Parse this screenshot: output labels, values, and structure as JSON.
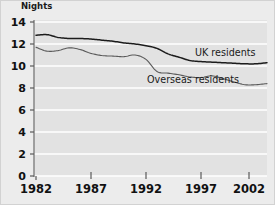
{
  "chart_data": {
    "type": "line",
    "title": "",
    "ylabel": "Nights",
    "xlabel": "",
    "ylim": [
      0,
      14
    ],
    "xlim": [
      1982,
      2003
    ],
    "grid": true,
    "grid_color": "#ffffff",
    "plot_background": "#e2e2e2",
    "figure_background": "#ececec",
    "legend_position": "inline-labels",
    "y_ticks": [
      0,
      2,
      4,
      6,
      8,
      10,
      12,
      14
    ],
    "y_tick_labels": [
      "0",
      "2",
      "4",
      "6",
      "8",
      "10",
      "12",
      "14"
    ],
    "x_ticks": [
      1982,
      1987,
      1992,
      1997,
      2002
    ],
    "x_tick_labels": [
      "1982",
      "1987",
      "1992",
      "1997",
      "2002"
    ],
    "x": [
      1982,
      1983,
      1984,
      1985,
      1986,
      1987,
      1988,
      1989,
      1990,
      1991,
      1992,
      1993,
      1994,
      1995,
      1996,
      1997,
      1998,
      1999,
      2000,
      2001,
      2002,
      2003
    ],
    "series": [
      {
        "name": "UK residents",
        "label": "UK residents",
        "color": "#1c1c1c",
        "width": 1.5,
        "values": [
          12.8,
          12.85,
          12.6,
          12.5,
          12.5,
          12.45,
          12.35,
          12.25,
          12.1,
          12.0,
          11.85,
          11.6,
          11.1,
          10.8,
          10.5,
          10.4,
          10.35,
          10.3,
          10.25,
          10.2,
          10.2,
          10.3
        ]
      },
      {
        "name": "Overseas residents",
        "label": "Overseas residents",
        "color": "#5a5a5a",
        "width": 1.1,
        "values": [
          11.7,
          11.35,
          11.4,
          11.65,
          11.5,
          11.15,
          10.95,
          10.9,
          10.85,
          11.0,
          10.6,
          9.5,
          9.35,
          9.2,
          9.0,
          8.95,
          9.1,
          8.85,
          8.55,
          8.3,
          8.3,
          8.4
        ]
      }
    ],
    "annotations": [
      {
        "text": "UK residents",
        "x_px": 195,
        "y_px": 47
      },
      {
        "text": "Overseas residents",
        "x_px": 147,
        "y_px": 74
      }
    ]
  },
  "axis": {
    "y_title": "Nights"
  }
}
